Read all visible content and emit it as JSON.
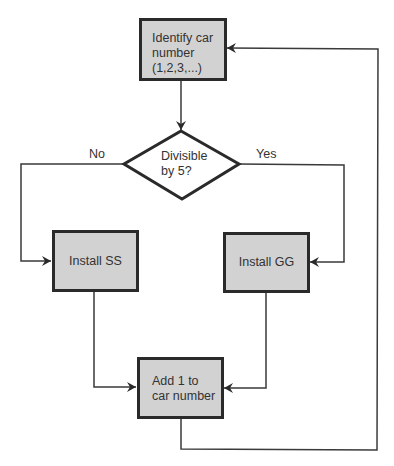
{
  "diagram": {
    "type": "flowchart",
    "nodes": {
      "start": {
        "label": "Identify car\nnumber\n(1,2,3,...)",
        "shape": "rectangle"
      },
      "decision": {
        "label": "Divisible\nby 5?",
        "shape": "diamond"
      },
      "install_ss": {
        "label": "Install SS",
        "shape": "rectangle"
      },
      "install_gg": {
        "label": "Install GG",
        "shape": "rectangle"
      },
      "increment": {
        "label": "Add 1 to\ncar number",
        "shape": "rectangle"
      }
    },
    "edge_labels": {
      "no": "No",
      "yes": "Yes"
    },
    "edges": [
      {
        "from": "start",
        "to": "decision"
      },
      {
        "from": "decision",
        "to": "install_ss",
        "label": "No"
      },
      {
        "from": "decision",
        "to": "install_gg",
        "label": "Yes"
      },
      {
        "from": "install_ss",
        "to": "increment"
      },
      {
        "from": "install_gg",
        "to": "increment"
      },
      {
        "from": "increment",
        "to": "start"
      }
    ],
    "colors": {
      "box_fill": "#d2d2d2",
      "box_border": "#2a2a2a",
      "line": "#3a3a3a",
      "text": "#333333"
    }
  }
}
